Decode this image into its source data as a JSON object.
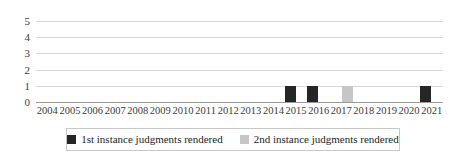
{
  "chart_data": {
    "type": "bar",
    "title": "",
    "xlabel": "",
    "ylabel": "",
    "ylim": [
      0,
      5
    ],
    "yticks": [
      "0",
      "1",
      "2",
      "3",
      "4",
      "5"
    ],
    "grid": true,
    "legend_position": "bottom",
    "categories": [
      "2004",
      "2005",
      "2006",
      "2007",
      "2008",
      "2009",
      "2010",
      "2011",
      "2012",
      "2013",
      "2014",
      "2015",
      "2016",
      "2017",
      "2018",
      "2019",
      "2020",
      "2021"
    ],
    "series": [
      {
        "name": "1st instance judgments rendered",
        "color": "#262626",
        "values": [
          0,
          0,
          0,
          0,
          0,
          0,
          0,
          0,
          0,
          0,
          0,
          1,
          1,
          0,
          0,
          0,
          0,
          1
        ]
      },
      {
        "name": "2nd instance judgments rendered",
        "color": "#c6c6c6",
        "values": [
          0,
          0,
          0,
          0,
          0,
          0,
          0,
          0,
          0,
          0,
          0,
          0,
          0,
          1,
          0,
          0,
          0,
          0
        ]
      }
    ]
  },
  "legend": {
    "entries": [
      {
        "label": "1st instance judgments rendered",
        "swatch_color": "#262626"
      },
      {
        "label": "2nd instance judgments rendered",
        "swatch_color": "#c6c6c6"
      }
    ]
  }
}
